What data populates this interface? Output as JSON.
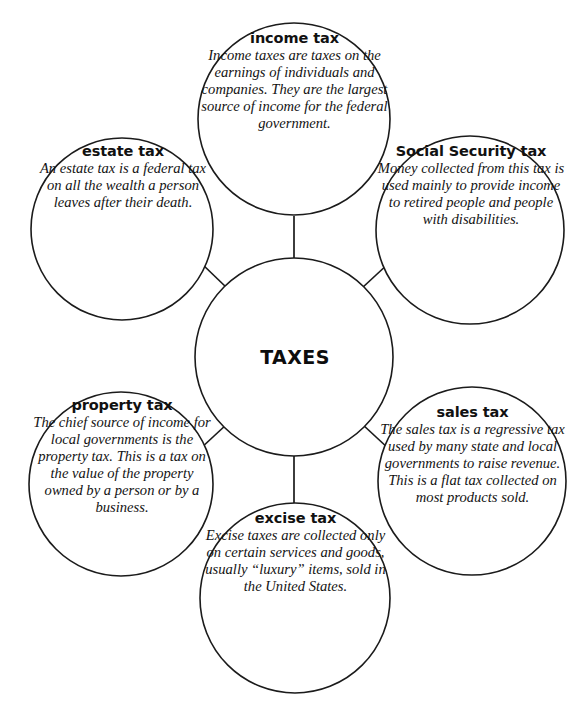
{
  "diagram": {
    "type": "concept-map",
    "center": {
      "label": "TAXES"
    },
    "nodes": [
      {
        "id": "income-tax",
        "title": "income tax",
        "description": "Income taxes are taxes on the earnings of individuals and companies. They are the largest source of income for the federal government.",
        "position": "top"
      },
      {
        "id": "estate-tax",
        "title": "estate tax",
        "description": "An estate tax is a federal tax on all the wealth a person leaves after their death.",
        "position": "top-left"
      },
      {
        "id": "social-security-tax",
        "title": "Social Security tax",
        "description": "Money collected from this tax is used mainly to provide income to retired people and people with disabilities.",
        "position": "top-right"
      },
      {
        "id": "property-tax",
        "title": "property tax",
        "description": "The chief source of income for local governments is the property tax. This is a tax on the value of the property owned by a person or by a business.",
        "position": "bottom-left"
      },
      {
        "id": "sales-tax",
        "title": "sales tax",
        "description": "The sales tax is a regressive tax used by many state and local governments to raise revenue. This is a flat tax collected on most products sold.",
        "position": "bottom-right"
      },
      {
        "id": "excise-tax",
        "title": "excise tax",
        "description": "Excise taxes are collected only on certain services and goods, usually “luxury” items, sold in the United States.",
        "position": "bottom"
      }
    ],
    "colors": {
      "background": "#ffffff",
      "stroke": "#1b1b1b",
      "text": "#111111"
    }
  }
}
